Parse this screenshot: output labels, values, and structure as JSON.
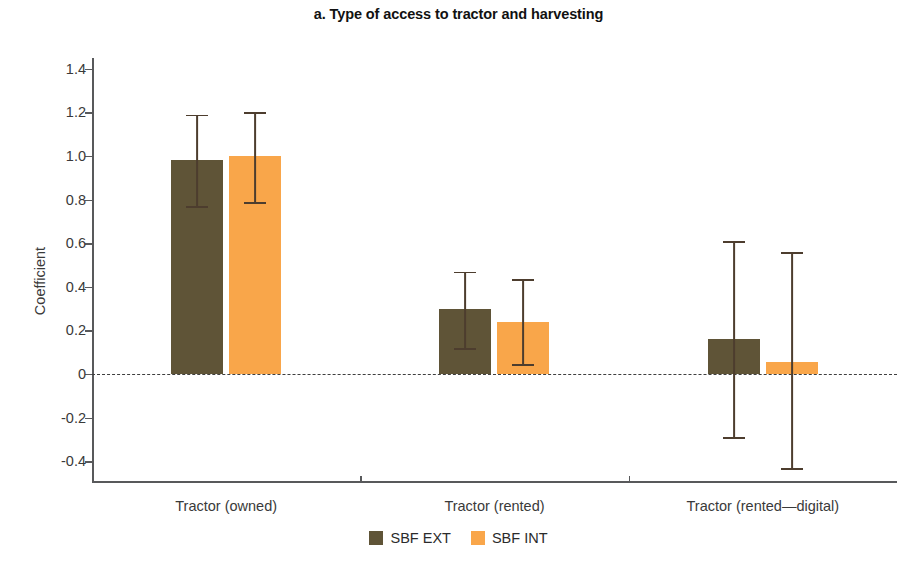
{
  "chart_data": {
    "type": "bar",
    "title": "a. Type of access to tractor and harvesting",
    "xlabel": "",
    "ylabel": "Coefficient",
    "ylim": [
      -0.5,
      1.45
    ],
    "yticks": [
      1.4,
      1.2,
      1.0,
      0.8,
      0.6,
      0.4,
      0.2,
      0,
      -0.2,
      -0.4
    ],
    "ytick_labels": [
      "1.4",
      "1.2",
      "1.0",
      "0.8",
      "0.6",
      "0.4",
      "0.2",
      "0",
      "-0.2",
      "-0.4"
    ],
    "grid": false,
    "zero_line": true,
    "legend_position": "bottom-center",
    "categories": [
      "Tractor (owned)",
      "Tractor (rented)",
      "Tractor (rented—digital)"
    ],
    "series": [
      {
        "name": "SBF EXT",
        "color": "#5f5437",
        "values": [
          0.98,
          0.3,
          0.16
        ],
        "error_low": [
          0.77,
          0.12,
          -0.29
        ],
        "error_high": [
          1.19,
          0.47,
          0.61
        ]
      },
      {
        "name": "SBF INT",
        "color": "#f9a64a",
        "values": [
          1.0,
          0.24,
          0.055
        ],
        "error_low": [
          0.79,
          0.045,
          -0.43
        ],
        "error_high": [
          1.2,
          0.435,
          0.56
        ]
      }
    ]
  },
  "legend": {
    "items": [
      {
        "label": "SBF EXT",
        "color": "#5f5437"
      },
      {
        "label": "SBF INT",
        "color": "#f9a64a"
      }
    ]
  }
}
